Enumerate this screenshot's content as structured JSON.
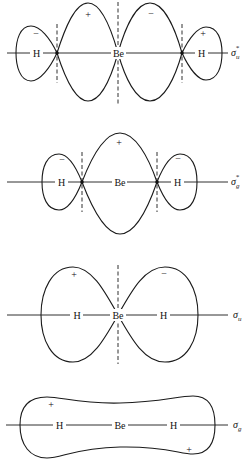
{
  "diagram": {
    "panels": [
      {
        "id": "sigma_u_star",
        "label": "σ",
        "label_sub": "u",
        "label_sup": "*",
        "atoms": [
          "H",
          "Be",
          "H"
        ],
        "signs": [
          "−",
          "+",
          "−",
          "+"
        ]
      },
      {
        "id": "sigma_g_star",
        "label": "σ",
        "label_sub": "g",
        "label_sup": "*",
        "atoms": [
          "H",
          "Be",
          "H"
        ],
        "signs": [
          "−",
          "+",
          "−"
        ]
      },
      {
        "id": "sigma_u",
        "label": "σ",
        "label_sub": "u",
        "label_sup": "",
        "atoms": [
          "H",
          "Be",
          "H"
        ],
        "signs": [
          "+",
          "−"
        ]
      },
      {
        "id": "sigma_g",
        "label": "σ",
        "label_sub": "g",
        "label_sup": "",
        "atoms": [
          "H",
          "Be",
          "H"
        ],
        "signs": [
          "+",
          "+"
        ]
      }
    ]
  }
}
